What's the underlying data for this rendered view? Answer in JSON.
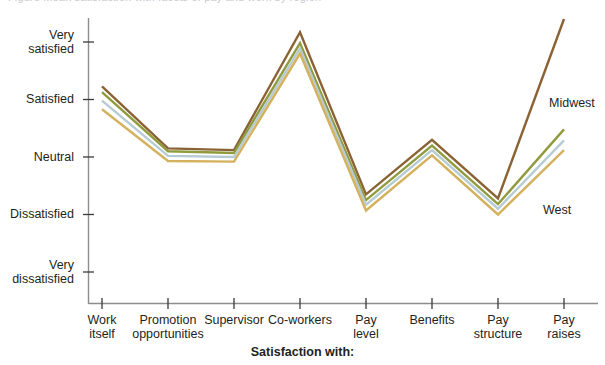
{
  "clipped_header": "Figure  Mean satisfaction with facets of pay and work by region",
  "chart_data": {
    "type": "line",
    "title": "",
    "xlabel": "Satisfaction with:",
    "ylabel": "",
    "grid": false,
    "legend_position": "inline-right",
    "categories": [
      "Work\nitself",
      "Promotion\nopportunities",
      "Supervisor",
      "Co-workers",
      "Pay\nlevel",
      "Benefits",
      "Pay\nstructure",
      "Pay\nraises"
    ],
    "ytick_labels": [
      "Very\nsatisfied",
      "Satisfied",
      "Neutral",
      "Dissatisfied",
      "Very\ndissatisfied"
    ],
    "ytick_values": [
      5,
      4,
      3,
      2,
      1
    ],
    "ylim": [
      1,
      5
    ],
    "series": [
      {
        "name": "Midwest",
        "color": "#8a6233",
        "values": [
          4.23,
          3.15,
          3.12,
          5.17,
          2.35,
          3.3,
          2.28,
          5.4
        ]
      },
      {
        "name": "series-2",
        "color": "#8f9b3c",
        "values": [
          4.13,
          3.1,
          3.07,
          4.98,
          2.25,
          3.2,
          2.18,
          3.48
        ]
      },
      {
        "name": "series-3",
        "color": "#b6cbd3",
        "values": [
          3.98,
          3.02,
          3.0,
          4.89,
          2.17,
          3.12,
          2.1,
          3.29
        ]
      },
      {
        "name": "West",
        "color": "#d4b15c",
        "values": [
          3.83,
          2.93,
          2.92,
          4.8,
          2.07,
          3.03,
          2.0,
          3.12
        ]
      }
    ],
    "annotations": [
      {
        "text": "Midwest",
        "x": 549,
        "y": 96
      },
      {
        "text": "West",
        "x": 543,
        "y": 203
      }
    ]
  }
}
